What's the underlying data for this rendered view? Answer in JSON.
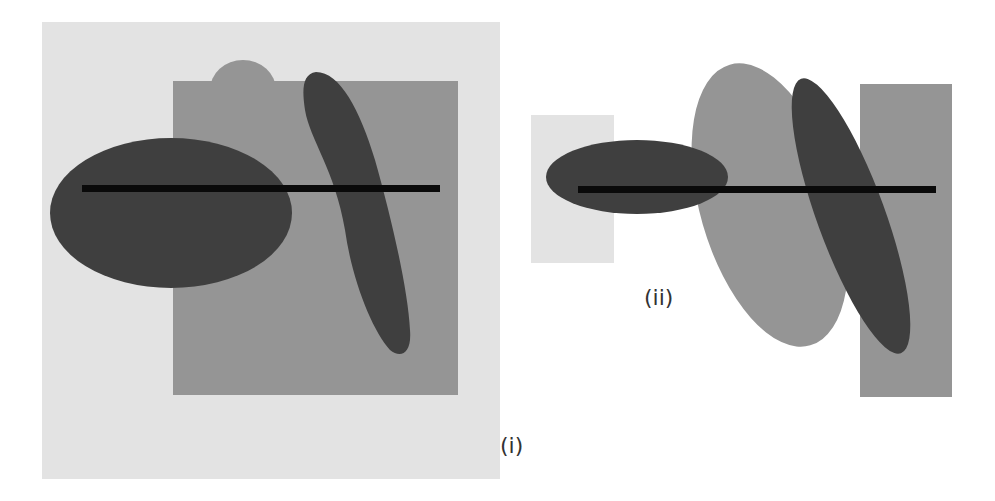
{
  "panels": [
    {
      "id": "i",
      "label": "(i)"
    },
    {
      "id": "ii",
      "label": "(ii)"
    }
  ],
  "colors": {
    "background": "#ffffff",
    "light_gray": "#e3e3e3",
    "mid_gray": "#959595",
    "dark_gray": "#3f3f3f",
    "line_black": "#0a0a0a"
  }
}
